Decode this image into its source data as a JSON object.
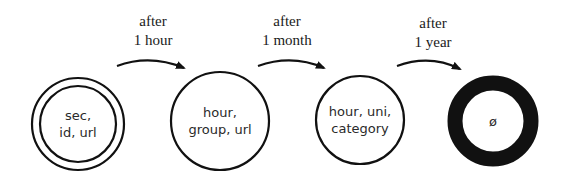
{
  "diagram": {
    "stages": [
      {
        "line1": "sec,",
        "line2": "id, url",
        "style": "double-circle"
      },
      {
        "line1": "hour,",
        "line2": "group, url",
        "style": "circle"
      },
      {
        "line1": "hour, uni,",
        "line2": "category",
        "style": "circle"
      },
      {
        "line1": "ø",
        "line2": "",
        "style": "thick-ring"
      }
    ],
    "transitions": [
      {
        "line1": "after",
        "line2": "1 hour"
      },
      {
        "line1": "after",
        "line2": "1 month"
      },
      {
        "line1": "after",
        "line2": "1 year"
      }
    ],
    "colors": {
      "stroke": "#111111",
      "background": "#ffffff"
    }
  }
}
